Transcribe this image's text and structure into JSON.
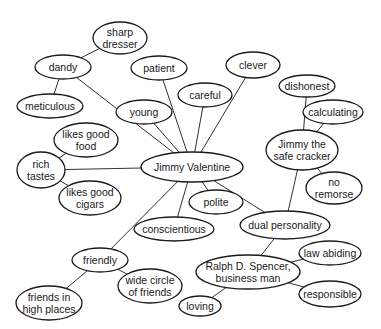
{
  "colors": {
    "stroke": "#1a1a1a",
    "fill": "#ffffff",
    "text": "#1a1a1a"
  },
  "nodes": [
    {
      "id": "jimmy-valentine",
      "lines": [
        "Jimmy Valentine"
      ],
      "cx": 192,
      "cy": 167,
      "rx": 51,
      "ry": 15
    },
    {
      "id": "dandy",
      "lines": [
        "dandy"
      ],
      "cx": 63,
      "cy": 67,
      "rx": 28,
      "ry": 12
    },
    {
      "id": "sharp-dresser",
      "lines": [
        "sharp",
        "dresser"
      ],
      "cx": 120,
      "cy": 38,
      "rx": 27,
      "ry": 16
    },
    {
      "id": "meticulous",
      "lines": [
        "meticulous"
      ],
      "cx": 50,
      "cy": 106,
      "rx": 33,
      "ry": 12
    },
    {
      "id": "patient",
      "lines": [
        "patient"
      ],
      "cx": 159,
      "cy": 68,
      "rx": 28,
      "ry": 12
    },
    {
      "id": "clever",
      "lines": [
        "clever"
      ],
      "cx": 253,
      "cy": 65,
      "rx": 27,
      "ry": 13
    },
    {
      "id": "careful",
      "lines": [
        "careful"
      ],
      "cx": 205,
      "cy": 95,
      "rx": 27,
      "ry": 12
    },
    {
      "id": "young",
      "lines": [
        "young"
      ],
      "cx": 144,
      "cy": 112,
      "rx": 28,
      "ry": 12
    },
    {
      "id": "likes-good-food",
      "lines": [
        "likes good",
        "food"
      ],
      "cx": 86,
      "cy": 140,
      "rx": 32,
      "ry": 17
    },
    {
      "id": "rich-tastes",
      "lines": [
        "rich",
        "tastes"
      ],
      "cx": 41,
      "cy": 170,
      "rx": 24,
      "ry": 18
    },
    {
      "id": "likes-good-cigars",
      "lines": [
        "likes good",
        "cigars"
      ],
      "cx": 90,
      "cy": 198,
      "rx": 31,
      "ry": 17
    },
    {
      "id": "dishonest",
      "lines": [
        "dishonest"
      ],
      "cx": 307,
      "cy": 86,
      "rx": 28,
      "ry": 11
    },
    {
      "id": "calculating",
      "lines": [
        "calculating"
      ],
      "cx": 333,
      "cy": 112,
      "rx": 30,
      "ry": 12
    },
    {
      "id": "jimmy-the-safe-cracker",
      "lines": [
        "Jimmy the",
        "safe cracker"
      ],
      "cx": 302,
      "cy": 150,
      "rx": 36,
      "ry": 20
    },
    {
      "id": "no-remorse",
      "lines": [
        "no",
        "remorse"
      ],
      "cx": 334,
      "cy": 188,
      "rx": 28,
      "ry": 16
    },
    {
      "id": "polite",
      "lines": [
        "polite"
      ],
      "cx": 216,
      "cy": 202,
      "rx": 27,
      "ry": 12
    },
    {
      "id": "conscientious",
      "lines": [
        "conscientious"
      ],
      "cx": 174,
      "cy": 229,
      "rx": 40,
      "ry": 12
    },
    {
      "id": "dual-personality",
      "lines": [
        "dual personality"
      ],
      "cx": 285,
      "cy": 225,
      "rx": 45,
      "ry": 14
    },
    {
      "id": "friendly",
      "lines": [
        "friendly"
      ],
      "cx": 100,
      "cy": 260,
      "rx": 28,
      "ry": 12
    },
    {
      "id": "wide-circle-of-friends",
      "lines": [
        "wide circle",
        "of friends"
      ],
      "cx": 150,
      "cy": 286,
      "rx": 32,
      "ry": 17
    },
    {
      "id": "friends-in-high-places",
      "lines": [
        "friends in",
        "high places"
      ],
      "cx": 49,
      "cy": 303,
      "rx": 33,
      "ry": 17
    },
    {
      "id": "law-abiding",
      "lines": [
        "law abiding"
      ],
      "cx": 330,
      "cy": 253,
      "rx": 31,
      "ry": 12
    },
    {
      "id": "ralph-d-spencer",
      "lines": [
        "Ralph D. Spencer,",
        "business man"
      ],
      "cx": 248,
      "cy": 272,
      "rx": 52,
      "ry": 17
    },
    {
      "id": "responsible",
      "lines": [
        "responsible"
      ],
      "cx": 330,
      "cy": 294,
      "rx": 31,
      "ry": 13
    },
    {
      "id": "loving",
      "lines": [
        "loving"
      ],
      "cx": 200,
      "cy": 306,
      "rx": 21,
      "ry": 10
    }
  ],
  "edges": [
    [
      "sharp-dresser",
      "dandy"
    ],
    [
      "dandy",
      "meticulous"
    ],
    [
      "dandy",
      "jimmy-valentine"
    ],
    [
      "patient",
      "jimmy-valentine"
    ],
    [
      "clever",
      "jimmy-valentine"
    ],
    [
      "careful",
      "jimmy-valentine"
    ],
    [
      "young",
      "jimmy-valentine"
    ],
    [
      "likes-good-food",
      "rich-tastes"
    ],
    [
      "rich-tastes",
      "jimmy-valentine"
    ],
    [
      "rich-tastes",
      "likes-good-cigars"
    ],
    [
      "jimmy-valentine",
      "polite"
    ],
    [
      "jimmy-valentine",
      "conscientious"
    ],
    [
      "jimmy-valentine",
      "friendly"
    ],
    [
      "jimmy-valentine",
      "dual-personality"
    ],
    [
      "dishonest",
      "jimmy-the-safe-cracker"
    ],
    [
      "calculating",
      "jimmy-the-safe-cracker"
    ],
    [
      "jimmy-the-safe-cracker",
      "no-remorse"
    ],
    [
      "jimmy-the-safe-cracker",
      "dual-personality"
    ],
    [
      "friendly",
      "wide-circle-of-friends"
    ],
    [
      "friendly",
      "friends-in-high-places"
    ],
    [
      "dual-personality",
      "ralph-d-spencer"
    ],
    [
      "ralph-d-spencer",
      "law-abiding"
    ],
    [
      "ralph-d-spencer",
      "responsible"
    ],
    [
      "ralph-d-spencer",
      "loving"
    ]
  ]
}
